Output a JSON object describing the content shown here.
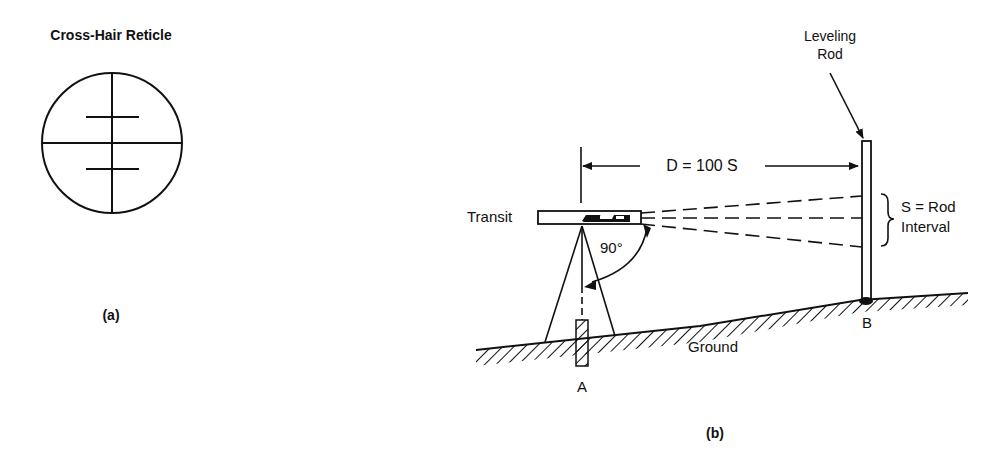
{
  "panel_a": {
    "title": "Cross-Hair Reticle",
    "caption": "(a)"
  },
  "panel_b": {
    "caption": "(b)",
    "transit_label": "Transit",
    "angle_label": "90°",
    "distance_label": "D = 100 S",
    "rod_label_line1": "Leveling",
    "rod_label_line2": "Rod",
    "interval_label_line1": "S = Rod",
    "interval_label_line2": "Interval",
    "ground_label": "Ground",
    "point_a_label": "A",
    "point_b_label": "B"
  },
  "colors": {
    "ink": "#111111",
    "background": "#ffffff"
  }
}
